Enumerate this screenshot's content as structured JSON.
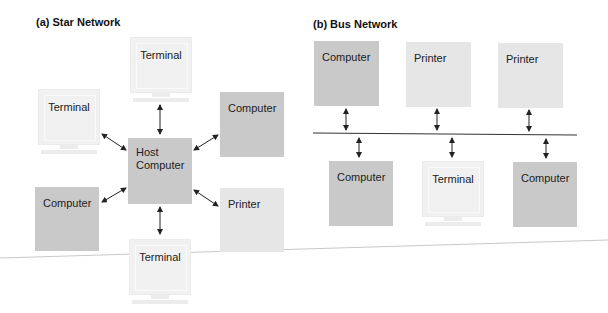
{
  "star": {
    "title": "(a) Star Network",
    "host": "Host\nComputer",
    "host_line1": "Host",
    "host_line2": "Computer",
    "nodes": [
      {
        "type": "terminal",
        "label": "Terminal",
        "position": "top"
      },
      {
        "type": "terminal",
        "label": "Terminal",
        "position": "upper-left"
      },
      {
        "type": "computer",
        "label": "Computer",
        "position": "upper-right"
      },
      {
        "type": "computer",
        "label": "Computer",
        "position": "lower-left"
      },
      {
        "type": "printer",
        "label": "Printer",
        "position": "lower-right"
      },
      {
        "type": "terminal",
        "label": "Terminal",
        "position": "bottom"
      }
    ]
  },
  "bus": {
    "title": "(b) Bus Network",
    "top_nodes": [
      {
        "type": "computer",
        "label": "Computer"
      },
      {
        "type": "printer",
        "label": "Printer"
      },
      {
        "type": "printer",
        "label": "Printer"
      }
    ],
    "bottom_nodes": [
      {
        "type": "computer",
        "label": "Computer"
      },
      {
        "type": "terminal",
        "label": "Terminal"
      },
      {
        "type": "computer",
        "label": "Computer"
      }
    ]
  },
  "colors": {
    "computer": "#c9c9c9",
    "printer": "#e6e6e6",
    "terminal": "#f1f1f1"
  }
}
